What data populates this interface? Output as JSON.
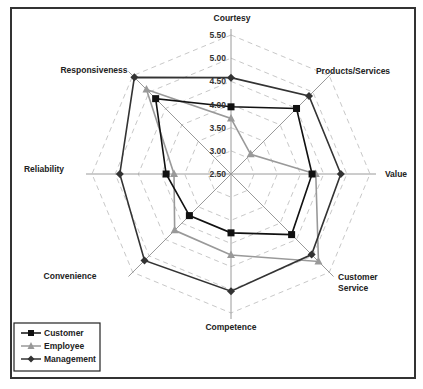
{
  "chart_data": {
    "type": "radar",
    "title": "",
    "categories": [
      "Courtesy",
      "Products/Services",
      "Value",
      "Customer Service",
      "Competence",
      "Convenience",
      "Reliability",
      "Responsiveness"
    ],
    "category_labels_display": [
      [
        "Courtesy"
      ],
      [
        "Products/Services"
      ],
      [
        "Value"
      ],
      [
        "Customer",
        "Service"
      ],
      [
        "Competence"
      ],
      [
        "Convenience"
      ],
      [
        "Reliability"
      ],
      [
        "Responsiveness"
      ]
    ],
    "series": [
      {
        "name": "Customer",
        "color": "#111111",
        "marker": "square",
        "values": [
          3.95,
          4.5,
          4.25,
          4.35,
          3.77,
          3.77,
          3.9,
          4.8
        ]
      },
      {
        "name": "Employee",
        "color": "#999999",
        "marker": "triangle",
        "values": [
          3.7,
          3.1,
          4.33,
          5.17,
          4.25,
          4.22,
          3.73,
          5.08
        ]
      },
      {
        "name": "Management",
        "color": "#333333",
        "marker": "diamond",
        "values": [
          4.58,
          4.88,
          4.87,
          4.96,
          5.03,
          5.14,
          4.9,
          5.45
        ]
      }
    ],
    "radial_ticks": [
      "2.50",
      "3.00",
      "3.50",
      "4.00",
      "4.50",
      "5.00",
      "5.50"
    ],
    "rlim": [
      2.5,
      5.5
    ],
    "grid": "dashed octagon rings",
    "legend_position": "bottom-left"
  },
  "legend": {
    "items": [
      {
        "label": "Customer"
      },
      {
        "label": "Employee"
      },
      {
        "label": "Management"
      }
    ]
  }
}
